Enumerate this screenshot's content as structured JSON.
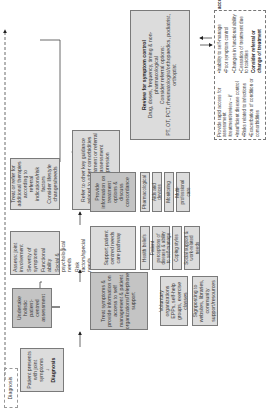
{
  "diagram": {
    "orientation": "rotated -90deg",
    "diagnosis_label": "Diagnosis",
    "patient_presents": {
      "text": "Patient presents with joint symptoms",
      "arrow": "↓",
      "bold": "Diagnosis"
    },
    "holistic_assessment": "Undertake holistic patient-centred assessment",
    "assess_box": [
      "Assess: joint involvement",
      "Severity of symptoms",
      "Functional ability",
      "Social & psychological needs",
      "Risk factors/special needs"
    ],
    "treat_refer_box": [
      "Treat or refer for additional therapies according to referral indications/risk factors",
      "Consider lifestyle changes/needs"
    ],
    "refer_key_guidance": [
      "Refer to other key guidance related to other comorbidities that require treatment or referral based on assessment",
      "e.g. depression"
    ],
    "treat_symptoms_box": "Treat symptoms & provide information on access to self management & patient organizations/Telephone support",
    "support_pathway": "Support patient centred needs care pathway",
    "provide_information": "Provide information on treatment options & discuss concordance",
    "voluntary_orgs": "Voluntary organizations EPPs, self-help groups, exercise classes",
    "signposting": "Signposting to websites, libraries, community support/resources",
    "support_items": [
      "Health beliefs",
      "Patient perceptions of disease & ability to self-manage",
      "Coping styles",
      "Social support & work-related needs"
    ],
    "info_items": [
      "Pharmacological",
      "Aids and devices",
      "Monitoring",
      "Multi-professional care"
    ],
    "review": {
      "title": "Review for symptom control",
      "lines": [
        "Drug, doses, frequency, timing & non-pharmacological",
        "Consider referral options:",
        "PT, OT, PCT, rheumatologist/orthopaedics, podiatrist, orthoptist"
      ]
    },
    "rapid_access": {
      "intro": "Provide rapid access for assessment /treatment/review – if",
      "bullets": [
        "•Insufficient disease control",
        "•Risks related to infections",
        "•Exacerbation of condition or comorbidities",
        "•Inability to self-manage",
        "•Poor symptom control",
        "•Changes in functional ability",
        "•Cessation of treatment due to toxicities"
      ],
      "bold": "Consider referral or change of treatment accordingly"
    }
  }
}
